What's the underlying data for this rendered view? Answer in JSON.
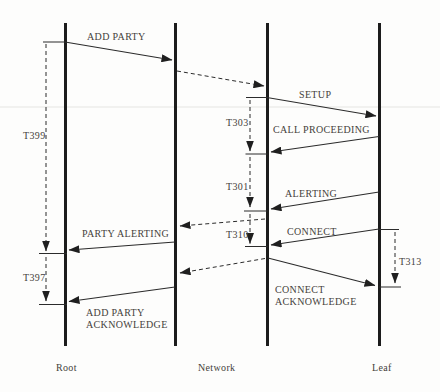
{
  "diagram": {
    "endpoints": {
      "root": "Root",
      "network": "Network",
      "leaf": "Leaf"
    },
    "messages": {
      "add_party": "ADD PARTY",
      "setup": "SETUP",
      "call_proceeding": "CALL PROCEEDING",
      "alerting": "ALERTING",
      "connect": "CONNECT",
      "party_alerting": "PARTY ALERTING",
      "add_party_acknowledge": {
        "line1": "ADD PARTY",
        "line2": "ACKNOWLEDGE"
      },
      "connect_acknowledge": {
        "line1": "CONNECT",
        "line2": "ACKNOWLEDGE"
      }
    },
    "timers": {
      "t399": "T399",
      "t303": "T303",
      "t301": "T301",
      "t310": "T310",
      "t397": "T397",
      "t313": "T313"
    },
    "colors": {
      "line": "#1c1c1c",
      "text": "#45413b",
      "background": "#fdfdfc"
    }
  }
}
